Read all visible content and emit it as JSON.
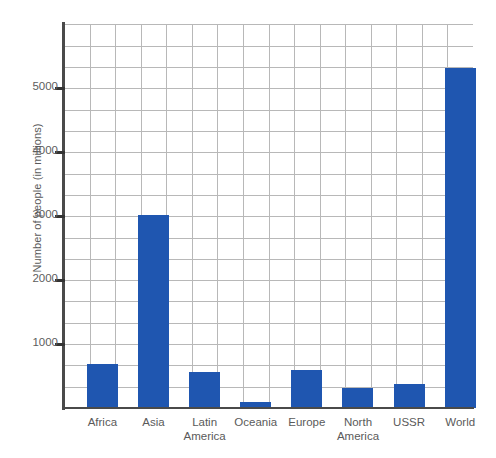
{
  "chart_data": {
    "type": "bar",
    "title": "",
    "subtitle": "",
    "xlabel": "",
    "ylabel": "Number of people (in millions)",
    "categories": [
      "Africa",
      "Asia",
      "Latin\nAmerica",
      "Oceania",
      "Europe",
      "North\nAmerica",
      "USSR",
      "World"
    ],
    "values": [
      690,
      3020,
      560,
      100,
      590,
      310,
      375,
      5310
    ],
    "ylim": [
      0,
      6000
    ],
    "yticks": [
      1000,
      2000,
      3000,
      4000,
      5000
    ],
    "ytick_labels": [
      "1000",
      "2000",
      "3000",
      "4000",
      "5000"
    ],
    "grid": true,
    "grid_vertical_lines": 16,
    "grid_horizontal_step": 333,
    "legend": "none",
    "bar_color": "#1f56b0",
    "grid_color": "#b8b8b8",
    "axis_color": "#4a4a4a",
    "background": "#ffffff"
  },
  "axis": {
    "y_title": "Number of people (in millions)"
  },
  "categories_display": [
    {
      "line1": "Africa",
      "line2": ""
    },
    {
      "line1": "Asia",
      "line2": ""
    },
    {
      "line1": "Latin",
      "line2": "America"
    },
    {
      "line1": "Oceania",
      "line2": ""
    },
    {
      "line1": "Europe",
      "line2": ""
    },
    {
      "line1": "North",
      "line2": "America"
    },
    {
      "line1": "USSR",
      "line2": ""
    },
    {
      "line1": "World",
      "line2": ""
    }
  ]
}
